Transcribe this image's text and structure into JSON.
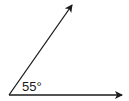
{
  "diagram": {
    "type": "angle",
    "angle_label": "55°",
    "angle_degrees": 55,
    "stroke_color": "#1a1a1a",
    "background": "#ffffff"
  }
}
